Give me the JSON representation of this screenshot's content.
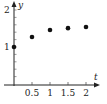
{
  "chart_data": {
    "type": "scatter",
    "title": "",
    "xlabel": "t",
    "ylabel": "y",
    "x_ticks": [
      "0.5",
      "1",
      "1.5",
      "2"
    ],
    "y_ticks": [
      "1",
      "2"
    ],
    "xlim": [
      0,
      2.2
    ],
    "ylim": [
      0,
      2.2
    ],
    "grid": false,
    "legend": null,
    "series": [
      {
        "name": "data",
        "points": [
          {
            "x": 0,
            "y": 1.0
          },
          {
            "x": 0.5,
            "y": 1.27
          },
          {
            "x": 1.0,
            "y": 1.46
          },
          {
            "x": 1.5,
            "y": 1.51
          },
          {
            "x": 2.0,
            "y": 1.54
          }
        ]
      }
    ],
    "colors": {
      "axis": "#222222",
      "point": "#111111"
    }
  }
}
